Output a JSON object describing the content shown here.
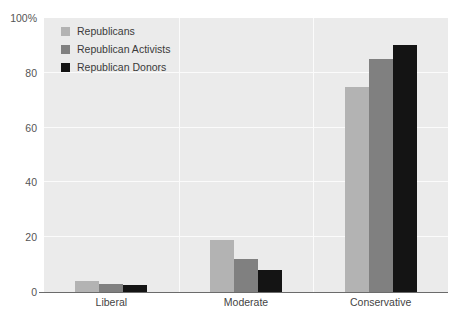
{
  "chart_data": {
    "type": "bar",
    "title": "",
    "subtitle": "",
    "xlabel": "",
    "ylabel": "",
    "categories": [
      "Liberal",
      "Moderate",
      "Conservative"
    ],
    "series": [
      {
        "name": "Republicans",
        "color": "#b3b3b3",
        "values": [
          4,
          19,
          75
        ]
      },
      {
        "name": "Republican Activists",
        "color": "#808080",
        "values": [
          3,
          12,
          85
        ]
      },
      {
        "name": "Republican Donors",
        "color": "#141414",
        "values": [
          2.5,
          8,
          90
        ]
      }
    ],
    "ylim": [
      0,
      100
    ],
    "ytick_values": [
      0,
      20,
      40,
      60,
      80,
      100
    ],
    "ytick_labels": [
      "0",
      "20",
      "40",
      "60",
      "80",
      "100%"
    ],
    "grid": true,
    "grid_color": "#fbfbfb",
    "legend_position": "top-left",
    "plot_background": "#ebebeb"
  }
}
